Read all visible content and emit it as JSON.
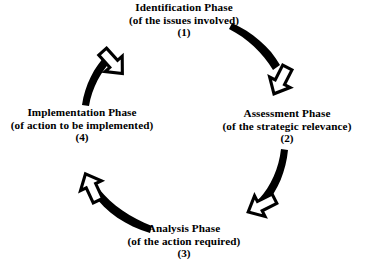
{
  "diagram": {
    "type": "circular-cycle",
    "direction": "clockwise",
    "background_color": "#ffffff",
    "stroke_color": "#000000",
    "phases": [
      {
        "id": "identification",
        "title": "Identification Phase",
        "subtitle": "(of the issues involved)",
        "number": "(1)",
        "position": "top"
      },
      {
        "id": "assessment",
        "title": "Assessment Phase",
        "subtitle": "(of the strategic relevance)",
        "number": "(2)",
        "position": "right"
      },
      {
        "id": "analysis",
        "title": "Analysis Phase",
        "subtitle": "(of the action required)",
        "number": "(3)",
        "position": "bottom"
      },
      {
        "id": "implementation",
        "title": "Implementation Phase",
        "subtitle": "(of action to be implemented)",
        "number": "(4)",
        "position": "left"
      }
    ],
    "connectors": [
      {
        "id": "arc-1-to-2",
        "from": "identification",
        "to": "assessment",
        "arrow": "block-arrow-down-right"
      },
      {
        "id": "arc-2-to-3",
        "from": "assessment",
        "to": "analysis",
        "arrow": "block-arrow-down-left"
      },
      {
        "id": "arc-3-to-4",
        "from": "analysis",
        "to": "implementation",
        "arrow": "block-arrow-up-left"
      },
      {
        "id": "arc-4-to-1",
        "from": "implementation",
        "to": "identification",
        "arrow": "block-arrow-up-right"
      }
    ]
  }
}
